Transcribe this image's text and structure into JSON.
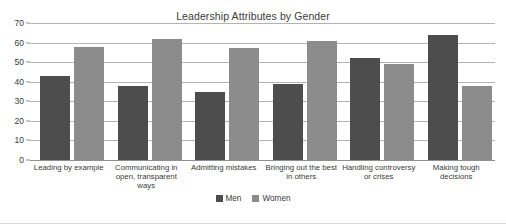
{
  "chart_data": {
    "type": "bar",
    "title": "Leadership Attributes by Gender",
    "xlabel": "",
    "ylabel": "",
    "ylim": [
      0,
      70
    ],
    "yticks": [
      0,
      10,
      20,
      30,
      40,
      50,
      60,
      70
    ],
    "grid": true,
    "legend_position": "bottom",
    "categories": [
      "Leading by example",
      "Communicating in open, transparent ways",
      "Admitting mistakes",
      "Bringing out the best in others",
      "Handling controversy or crises",
      "Making tough decisions"
    ],
    "series": [
      {
        "name": "Men",
        "color": "#4d4d4d",
        "values": [
          43,
          38,
          35,
          39,
          52,
          64
        ]
      },
      {
        "name": "Women",
        "color": "#8c8c8c",
        "values": [
          58,
          62,
          57,
          61,
          49,
          38
        ]
      }
    ]
  },
  "legend": {
    "items": [
      {
        "label": "Men",
        "color": "#4d4d4d"
      },
      {
        "label": "Women",
        "color": "#8c8c8c"
      }
    ]
  },
  "axis": {
    "tick_labels": [
      "0",
      "10",
      "20",
      "30",
      "40",
      "50",
      "60",
      "70"
    ]
  }
}
